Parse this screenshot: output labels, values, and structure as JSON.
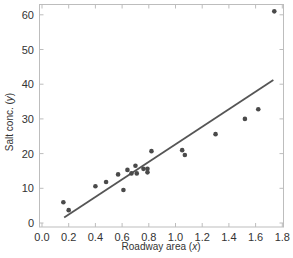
{
  "chart_data": {
    "type": "scatter",
    "title": "",
    "xlabel": "Roadway area",
    "xlabel_var": "x",
    "ylabel": "Salt conc.",
    "ylabel_var": "y",
    "xlim": [
      0.0,
      1.8
    ],
    "ylim": [
      0,
      63
    ],
    "xticks": [
      0.0,
      0.2,
      0.4,
      0.6,
      0.8,
      1.0,
      1.2,
      1.4,
      1.6,
      1.8
    ],
    "xtick_labels": [
      "0.0",
      "0.2",
      "0.4",
      "0.6",
      "0.8",
      "1.0",
      "1.2",
      "1.4",
      "1.6",
      "1.8"
    ],
    "yticks": [
      0,
      10,
      20,
      30,
      40,
      50,
      60
    ],
    "ytick_labels": [
      "0",
      "10",
      "20",
      "30",
      "40",
      "50",
      "60"
    ],
    "grid": false,
    "legend": null,
    "series": [
      {
        "name": "Observations",
        "type": "scatter",
        "color": "#4a4a4a",
        "x": [
          0.16,
          0.2,
          0.4,
          0.48,
          0.57,
          0.61,
          0.64,
          0.67,
          0.7,
          0.71,
          0.76,
          0.79,
          0.79,
          0.82,
          1.05,
          1.07,
          1.3,
          1.52,
          1.62,
          1.74
        ],
        "y": [
          6.0,
          3.7,
          10.6,
          11.8,
          14.0,
          9.5,
          15.3,
          14.3,
          16.5,
          14.3,
          15.6,
          15.6,
          14.6,
          20.7,
          21.0,
          19.6,
          25.6,
          30.0,
          32.8,
          61.0
        ]
      },
      {
        "name": "Least-squares fit",
        "type": "line",
        "color": "#555555",
        "x": [
          0.166,
          1.733
        ],
        "y": [
          1.6,
          41.2
        ]
      }
    ]
  },
  "axes": {
    "x_title": "Roadway area (",
    "x_var": "x",
    "x_close": ")",
    "y_title": "Salt conc. (",
    "y_var": "y",
    "y_close": ")"
  }
}
